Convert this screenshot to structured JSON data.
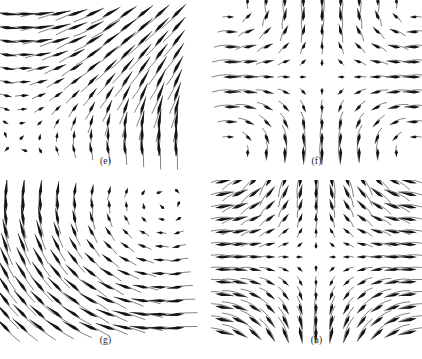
{
  "figure": {
    "background_color": "#ffffff",
    "ink_color": "#1b1b1b",
    "width": 422,
    "height": 359,
    "panel_count": 4
  },
  "panels": [
    {
      "id": "e",
      "caption": "(e)",
      "position": "top-left",
      "box": {
        "x": 6,
        "y": 14,
        "width": 170,
        "height": 136
      },
      "grid": {
        "cols": 11,
        "rows": 11
      },
      "domain": {
        "xmin": -1.0,
        "xmax": 1.0,
        "ymin": -1.0,
        "ymax": 1.0
      },
      "field": {
        "u": "y + 0.85",
        "v": "x + 0.85"
      },
      "arrow_scale": 20.0,
      "description": "Mostly rightward and up-right flow; arrow length grows toward the lower-right corner, short arrows near the upper-left."
    },
    {
      "id": "f",
      "caption": "(f)",
      "position": "top-right",
      "box": {
        "x": 18,
        "y": 2,
        "width": 186,
        "height": 150
      },
      "grid": {
        "cols": 11,
        "rows": 11
      },
      "domain": {
        "xmin": -1.0,
        "xmax": 1.0,
        "ymin": -1.0,
        "ymax": 1.0
      },
      "field": {
        "u": "-x * (1 - y*y) * 1.15",
        "v": "y * (1 - x*x) * 1.15"
      },
      "arrow_scale": 26.0,
      "description": "Saddle-type field: inflow horizontally toward the centre axis and outflow vertically; strong curving streams along the corners."
    },
    {
      "id": "g",
      "caption": "(g)",
      "position": "bottom-left",
      "box": {
        "x": 6,
        "y": 12,
        "width": 172,
        "height": 136
      },
      "grid": {
        "cols": 11,
        "rows": 11
      },
      "domain": {
        "xmin": -1.0,
        "xmax": 1.0,
        "ymin": -1.0,
        "ymax": 1.0
      },
      "field": {
        "u": "y - 0.85",
        "v": "-(x - 0.85)"
      },
      "arrow_scale": 20.0,
      "description": "Up-left flow in the upper-left, horizontal flow across the middle, upward flow in the lower-right; rotational character."
    },
    {
      "id": "h",
      "caption": "(h)",
      "position": "bottom-right",
      "box": {
        "x": 10,
        "y": 2,
        "width": 190,
        "height": 150
      },
      "grid": {
        "cols": 13,
        "rows": 13
      },
      "domain": {
        "xmin": -1.0,
        "xmax": 1.0,
        "ymin": -1.0,
        "ymax": 1.0
      },
      "field": {
        "u": "-x * 1.25",
        "v": "y * (1.15 - 0.85*x*x)"
      },
      "arrow_scale": 24.0,
      "description": "Mirror-symmetric about the vertical centre line: horizontal convergence toward the centre column and vertical divergence away from the mid-height; very long near-vertical arrows at the centre."
    }
  ],
  "chart_data": {
    "type": "scatter",
    "title": "",
    "xlabel": "",
    "ylabel": "",
    "subplots": [
      {
        "label": "(e)",
        "kind": "vector-field",
        "xlim": [
          -1,
          1
        ],
        "ylim": [
          -1,
          1
        ],
        "grid": false,
        "u_expression": "y + 0.85",
        "v_expression": "x + 0.85",
        "samples_x": 11,
        "samples_y": 11
      },
      {
        "label": "(f)",
        "kind": "vector-field",
        "xlim": [
          -1,
          1
        ],
        "ylim": [
          -1,
          1
        ],
        "grid": false,
        "u_expression": "-x*(1 - y^2)",
        "v_expression": "y*(1 - x^2)",
        "samples_x": 11,
        "samples_y": 11
      },
      {
        "label": "(g)",
        "kind": "vector-field",
        "xlim": [
          -1,
          1
        ],
        "ylim": [
          -1,
          1
        ],
        "grid": false,
        "u_expression": "y - 0.85",
        "v_expression": "-(x - 0.85)",
        "samples_x": 11,
        "samples_y": 11
      },
      {
        "label": "(h)",
        "kind": "vector-field",
        "xlim": [
          -1,
          1
        ],
        "ylim": [
          -1,
          1
        ],
        "grid": false,
        "u_expression": "-1.25*x",
        "v_expression": "y*(1.15 - 0.85*x^2)",
        "samples_x": 13,
        "samples_y": 13
      }
    ],
    "legend": [],
    "annotations": [
      "(e)",
      "(f)",
      "(g)",
      "(h)"
    ]
  }
}
